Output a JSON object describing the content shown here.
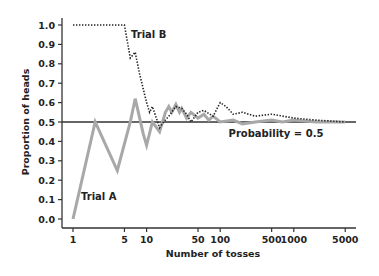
{
  "chart_data": {
    "type": "line",
    "title": "",
    "xlabel": "Number of tosses",
    "ylabel": "Proportion of heads",
    "xscale": "log",
    "xlim": [
      1,
      5000
    ],
    "ylim": [
      0.0,
      1.0
    ],
    "grid": false,
    "legend": null,
    "x_ticks": [
      1,
      5,
      10,
      50,
      100,
      500,
      1000,
      5000
    ],
    "x_tick_labels": [
      "1",
      "5",
      "10",
      "50",
      "100",
      "500",
      "1000",
      "5000"
    ],
    "y_ticks": [
      0.0,
      0.1,
      0.2,
      0.3,
      0.4,
      0.5,
      0.6,
      0.7,
      0.8,
      0.9,
      1.0
    ],
    "y_tick_labels": [
      "0.0",
      "0.1",
      "0.2",
      "0.3",
      "0.4",
      "0.5",
      "0.6",
      "0.7",
      "0.8",
      "0.9",
      "1.0"
    ],
    "reference_line": {
      "y": 0.5,
      "label": "Probability = 0.5"
    },
    "series": [
      {
        "name": "Trial A",
        "style": "solid gray",
        "color": "#a8a8a8",
        "x": [
          1,
          2,
          4,
          6,
          7,
          9,
          10,
          12,
          15,
          18,
          20,
          22,
          25,
          28,
          30,
          35,
          40,
          50,
          60,
          70,
          80,
          100,
          150,
          200,
          300,
          500,
          700,
          1000,
          2000,
          3000,
          5000
        ],
        "y": [
          0.0,
          0.5,
          0.25,
          0.5,
          0.62,
          0.44,
          0.38,
          0.5,
          0.45,
          0.55,
          0.58,
          0.55,
          0.59,
          0.55,
          0.57,
          0.52,
          0.55,
          0.52,
          0.54,
          0.51,
          0.53,
          0.5,
          0.51,
          0.49,
          0.5,
          0.51,
          0.5,
          0.51,
          0.5,
          0.5,
          0.5
        ]
      },
      {
        "name": "Trial B",
        "style": "dotted black",
        "color": "#222222",
        "x": [
          1,
          2,
          3,
          4,
          5,
          6,
          7,
          8,
          10,
          11,
          12,
          13,
          15,
          17,
          20,
          25,
          30,
          35,
          40,
          50,
          60,
          80,
          100,
          120,
          150,
          200,
          300,
          500,
          1000,
          2000,
          5000
        ],
        "y": [
          1.0,
          1.0,
          1.0,
          1.0,
          1.0,
          0.83,
          0.86,
          0.75,
          0.6,
          0.55,
          0.58,
          0.54,
          0.47,
          0.5,
          0.53,
          0.58,
          0.57,
          0.54,
          0.5,
          0.55,
          0.56,
          0.53,
          0.6,
          0.58,
          0.54,
          0.55,
          0.53,
          0.54,
          0.52,
          0.51,
          0.5
        ]
      }
    ],
    "annotations": [
      {
        "text": "Trial A",
        "x": 1.6,
        "y": 0.13
      },
      {
        "text": "Trial B",
        "x": 8.5,
        "y": 0.95
      },
      {
        "text": "Probability = 0.5",
        "x": 300,
        "y": 0.45
      }
    ]
  },
  "labels": {
    "xlabel": "Number of tosses",
    "ylabel": "Proportion of heads",
    "trial_a": "Trial A",
    "trial_b": "Trial B",
    "probability": "Probability = 0.5"
  }
}
